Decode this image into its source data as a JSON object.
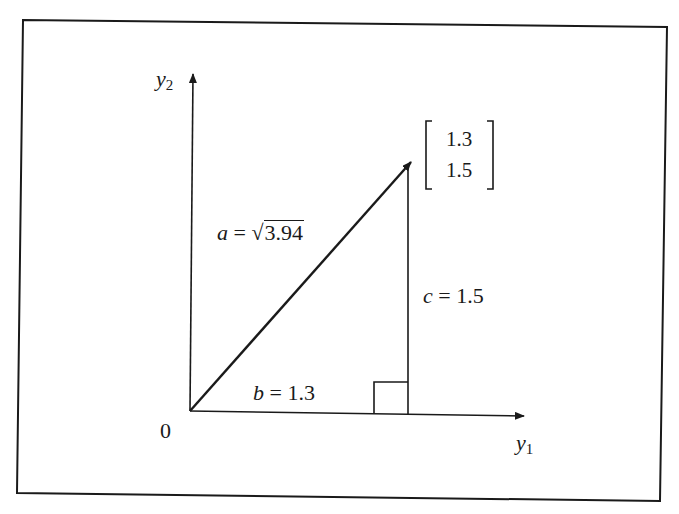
{
  "figure": {
    "type": "vector-magnitude-pythagorean",
    "axes": {
      "x_label_base": "y",
      "x_label_sub": "1",
      "y_label_base": "y",
      "y_label_sub": "2",
      "origin_label": "0"
    },
    "vector": {
      "components": [
        "1.3",
        "1.5"
      ]
    },
    "hypotenuse": {
      "var": "a",
      "equals": " = ",
      "sqrt_symbol": "√",
      "value": "3.94"
    },
    "base": {
      "var": "b",
      "equals": " = ",
      "value": "1.3"
    },
    "height": {
      "var": "c",
      "equals": " = ",
      "value": "1.5"
    }
  },
  "colors": {
    "ink": "#1a1a1a",
    "background": "#ffffff"
  }
}
